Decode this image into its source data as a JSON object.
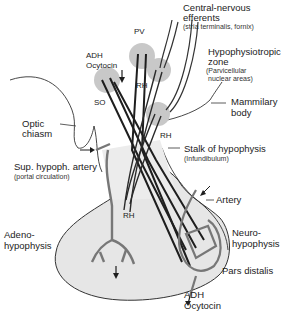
{
  "diagram": {
    "labels": {
      "central_nervous_efferents": "Central-nervous",
      "central_nervous_efferents_2": "efferents",
      "central_nervous_sub": "(stria terminalis, fornix)",
      "pv": "PV",
      "adh_top": "ADH",
      "ocytocin_top": "Ocytocin",
      "so": "SO",
      "rh_upper": "RH",
      "rh_middle": "RH",
      "hypophysiotropic_zone": "Hypophysiotropic",
      "hypophysiotropic_zone_2": "zone",
      "parvicellular": "(Parvicellular",
      "parvicellular_2": "nuclear areas)",
      "mammilary_body": "Mammilary",
      "mammilary_body_2": "body",
      "optic_chiasm": "Optic",
      "optic_chiasm_2": "chiasm",
      "sup_hypoph_artery": "Sup. hypoph. artery",
      "portal_circulation": "(portal circulation)",
      "stalk": "Stalk of hypophysis",
      "infundibulum": "(Infundibulum)",
      "rh_lower": "RH",
      "artery": "Artery",
      "adenohypophysis": "Adeno-",
      "adenohypophysis_2": "hypophysis",
      "neurohypophysis": "Neuro-",
      "neurohypophysis_2": "hypophysis",
      "pars_distalis": "Pars distalis",
      "adh_bottom": "ADH",
      "ocytocin_bottom": "Ocytocin"
    },
    "colors": {
      "nucleus_fill": "#c8c8c8",
      "gland_fill": "#e6e6e6",
      "neuron": "#1e1e1e",
      "vessel": "#8a8a8a",
      "outline": "#333333"
    }
  }
}
